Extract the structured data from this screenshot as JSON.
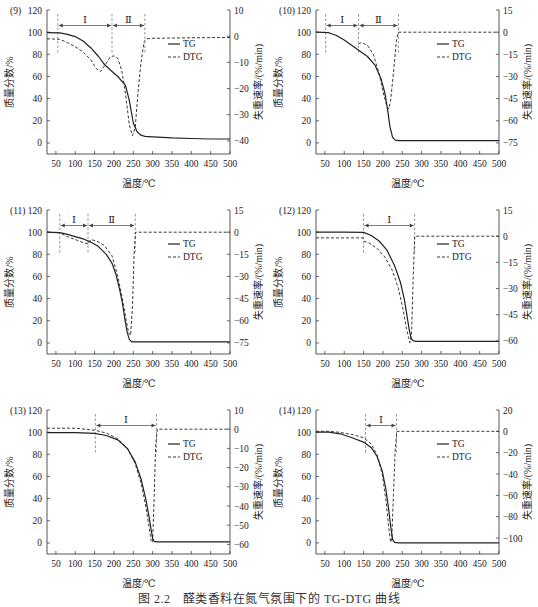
{
  "figure": {
    "caption": "图 2.2　醛类香料在氮气氛围下的 TG-DTG 曲线"
  },
  "chart_data": [
    {
      "type": "line",
      "panel_label": "(9)",
      "xlabel": "温度/℃",
      "ylabel": "质量分数/%",
      "y2label": "失重速率/(%/min)",
      "xlim": [
        27,
        500
      ],
      "ylim": [
        -10,
        120
      ],
      "y2lim": [
        -45,
        10
      ],
      "xticks": [
        50,
        100,
        150,
        200,
        250,
        300,
        350,
        400,
        450,
        500
      ],
      "yticks": [
        0,
        20,
        40,
        60,
        80,
        100,
        120
      ],
      "y2ticks": [
        -40,
        -30,
        -20,
        -10,
        0,
        10
      ],
      "legend": [
        "TG",
        "DTG"
      ],
      "stages": [
        {
          "label": "Ⅰ",
          "from": 55,
          "to": 195
        },
        {
          "label": "Ⅱ",
          "from": 195,
          "to": 280
        }
      ],
      "series": [
        {
          "name": "TG",
          "axis": "left",
          "style": "solid",
          "x": [
            27,
            60,
            80,
            100,
            120,
            140,
            160,
            175,
            190,
            210,
            230,
            240,
            250,
            260,
            270,
            280,
            300,
            350,
            400,
            450,
            500
          ],
          "y": [
            99.5,
            99.3,
            98,
            96,
            92,
            86,
            78,
            71,
            66,
            60,
            52,
            38,
            18,
            10,
            7,
            6,
            5.5,
            4.5,
            4,
            3.5,
            3.5
          ]
        },
        {
          "name": "DTG",
          "axis": "right",
          "style": "dashed",
          "x": [
            27,
            60,
            80,
            100,
            120,
            140,
            155,
            165,
            175,
            190,
            200,
            210,
            220,
            230,
            240,
            248,
            255,
            262,
            270,
            278,
            285,
            300,
            400,
            500
          ],
          "y": [
            -1,
            -1.2,
            -2.5,
            -4,
            -6,
            -9,
            -12.5,
            -13.5,
            -11.5,
            -8,
            -7.5,
            -8.5,
            -13,
            -22,
            -34,
            -38,
            -35,
            -22,
            -10,
            -2,
            -1,
            -0.8,
            -0.6,
            -0.5
          ]
        }
      ]
    },
    {
      "type": "line",
      "panel_label": "(10)",
      "xlabel": "温度/℃",
      "ylabel": "质量分数/%",
      "y2label": "失重速率/(%/min)",
      "xlim": [
        27,
        500
      ],
      "ylim": [
        -10,
        120
      ],
      "y2lim": [
        -82.5,
        15
      ],
      "xticks": [
        50,
        100,
        150,
        200,
        250,
        300,
        350,
        400,
        450,
        500
      ],
      "yticks": [
        0,
        20,
        40,
        60,
        80,
        100,
        120
      ],
      "y2ticks": [
        -75,
        -60,
        -45,
        -30,
        -15,
        0,
        15
      ],
      "legend": [
        "TG",
        "DTG"
      ],
      "stages": [
        {
          "label": "Ⅰ",
          "from": 52,
          "to": 137
        },
        {
          "label": "Ⅱ",
          "from": 137,
          "to": 240
        }
      ],
      "series": [
        {
          "name": "TG",
          "axis": "left",
          "style": "solid",
          "x": [
            27,
            60,
            80,
            100,
            120,
            140,
            160,
            180,
            195,
            205,
            212,
            218,
            225,
            232,
            240,
            260,
            300,
            400,
            500
          ],
          "y": [
            100,
            99.5,
            97,
            93,
            88,
            83,
            78,
            70,
            58,
            45,
            30,
            15,
            5,
            2.5,
            2,
            2,
            2,
            2,
            2
          ]
        },
        {
          "name": "DTG",
          "axis": "right",
          "style": "dashed",
          "x": [
            137,
            145,
            160,
            175,
            190,
            200,
            210,
            215,
            220,
            228,
            235,
            240,
            260,
            350,
            500
          ],
          "y": [
            -8,
            -7,
            -9,
            -15,
            -28,
            -40,
            -50,
            -52,
            -46,
            -25,
            -5,
            0,
            0,
            0,
            0
          ]
        }
      ]
    },
    {
      "type": "line",
      "panel_label": "(11)",
      "xlabel": "温度/℃",
      "ylabel": "质量分数/%",
      "y2label": "失重速率/(%/min)",
      "xlim": [
        27,
        500
      ],
      "ylim": [
        -10,
        120
      ],
      "y2lim": [
        -82.5,
        15
      ],
      "xticks": [
        50,
        100,
        150,
        200,
        250,
        300,
        350,
        400,
        450,
        500
      ],
      "yticks": [
        0,
        20,
        40,
        60,
        80,
        100,
        120
      ],
      "y2ticks": [
        -75,
        -60,
        -45,
        -30,
        -15,
        0,
        15
      ],
      "legend": [
        "TG",
        "DTG"
      ],
      "stages": [
        {
          "label": "Ⅰ",
          "from": 60,
          "to": 133
        },
        {
          "label": "Ⅱ",
          "from": 133,
          "to": 255
        }
      ],
      "series": [
        {
          "name": "TG",
          "axis": "left",
          "style": "solid",
          "x": [
            27,
            60,
            80,
            100,
            120,
            140,
            160,
            180,
            195,
            205,
            215,
            222,
            228,
            234,
            240,
            246,
            260,
            350,
            500
          ],
          "y": [
            100,
            99.5,
            98,
            96,
            94,
            91,
            87,
            80,
            72,
            62,
            48,
            36,
            22,
            10,
            3,
            1,
            1,
            1,
            1
          ]
        },
        {
          "name": "DTG",
          "axis": "right",
          "style": "dashed",
          "x": [
            27,
            60,
            80,
            100,
            120,
            133,
            140,
            155,
            175,
            195,
            210,
            222,
            232,
            238,
            243,
            248,
            252,
            256,
            300,
            500
          ],
          "y": [
            0,
            -0.5,
            -3,
            -5,
            -7,
            -8,
            -5,
            -6,
            -9,
            -16,
            -30,
            -45,
            -60,
            -68,
            -70,
            -50,
            -15,
            0,
            0,
            0
          ]
        }
      ]
    },
    {
      "type": "line",
      "panel_label": "(12)",
      "xlabel": "温度/℃",
      "ylabel": "质量分数/%",
      "y2label": "失重速率/(%/min)",
      "xlim": [
        27,
        500
      ],
      "ylim": [
        -10,
        120
      ],
      "y2lim": [
        -67.5,
        15
      ],
      "xticks": [
        50,
        100,
        150,
        200,
        250,
        300,
        350,
        400,
        450,
        500
      ],
      "yticks": [
        0,
        20,
        40,
        60,
        80,
        100,
        120
      ],
      "y2ticks": [
        -60,
        -45,
        -30,
        -15,
        0,
        15
      ],
      "legend": [
        "TG",
        "DTG"
      ],
      "stages": [
        {
          "label": "Ⅰ",
          "from": 150,
          "to": 282
        }
      ],
      "series": [
        {
          "name": "TG",
          "axis": "left",
          "style": "solid",
          "x": [
            27,
            100,
            150,
            170,
            190,
            210,
            230,
            245,
            255,
            262,
            268,
            273,
            278,
            285,
            300,
            400,
            500
          ],
          "y": [
            100,
            100,
            99.8,
            97,
            92,
            84,
            70,
            55,
            40,
            25,
            12,
            4,
            2,
            1.5,
            1.5,
            1.5,
            1.5
          ]
        },
        {
          "name": "DTG",
          "axis": "right",
          "style": "dashed",
          "x": [
            27,
            100,
            148,
            152,
            165,
            185,
            205,
            225,
            240,
            252,
            260,
            266,
            270,
            274,
            278,
            282,
            300,
            500
          ],
          "y": [
            -1,
            -1,
            -1,
            -3,
            -4,
            -7,
            -12,
            -20,
            -30,
            -42,
            -52,
            -58,
            -61,
            -55,
            -25,
            0,
            0,
            0
          ]
        }
      ]
    },
    {
      "type": "line",
      "panel_label": "(13)",
      "xlabel": "温度/℃",
      "ylabel": "质量分数/%",
      "y2label": "失重速率/(%/min)",
      "xlim": [
        27,
        500
      ],
      "ylim": [
        -10,
        120
      ],
      "y2lim": [
        -65,
        10
      ],
      "xticks": [
        50,
        100,
        150,
        200,
        250,
        300,
        350,
        400,
        450,
        500
      ],
      "yticks": [
        0,
        20,
        40,
        60,
        80,
        100,
        120
      ],
      "y2ticks": [
        -60,
        -50,
        -40,
        -30,
        -20,
        -10,
        0,
        10
      ],
      "legend": [
        "TG",
        "DTG"
      ],
      "stages": [
        {
          "label": "Ⅰ",
          "from": 152,
          "to": 310
        }
      ],
      "series": [
        {
          "name": "TG",
          "axis": "left",
          "style": "solid",
          "x": [
            27,
            100,
            150,
            180,
            210,
            235,
            255,
            270,
            282,
            290,
            296,
            300,
            304,
            310,
            350,
            500
          ],
          "y": [
            99.5,
            99.5,
            99,
            97,
            93,
            85,
            73,
            58,
            40,
            25,
            12,
            4,
            1.5,
            1,
            1,
            1
          ]
        },
        {
          "name": "DTG",
          "axis": "right",
          "style": "dashed",
          "x": [
            27,
            100,
            150,
            180,
            210,
            235,
            255,
            270,
            282,
            290,
            296,
            300,
            304,
            308,
            312,
            350,
            500
          ],
          "y": [
            0.5,
            0.5,
            -0.5,
            -2,
            -5,
            -10,
            -18,
            -28,
            -40,
            -50,
            -58,
            -59,
            -35,
            -8,
            0,
            0,
            0
          ]
        }
      ]
    },
    {
      "type": "line",
      "panel_label": "(14)",
      "xlabel": "温度/℃",
      "ylabel": "质量分数/%",
      "y2label": "失重速率/(%/min)",
      "xlim": [
        27,
        500
      ],
      "ylim": [
        -10,
        120
      ],
      "y2lim": [
        -115,
        20
      ],
      "xticks": [
        50,
        100,
        150,
        200,
        250,
        300,
        350,
        400,
        450,
        500
      ],
      "yticks": [
        0,
        20,
        40,
        60,
        80,
        100,
        120
      ],
      "y2ticks": [
        -100,
        -80,
        -60,
        -40,
        -20,
        0,
        20
      ],
      "legend": [
        "TG",
        "DTG"
      ],
      "stages": [
        {
          "label": "Ⅰ",
          "from": 155,
          "to": 235
        }
      ],
      "series": [
        {
          "name": "TG",
          "axis": "left",
          "style": "solid",
          "x": [
            27,
            60,
            90,
            120,
            150,
            170,
            185,
            198,
            208,
            215,
            220,
            225,
            230,
            240,
            300,
            500
          ],
          "y": [
            100,
            100,
            98.5,
            95,
            91,
            86,
            78,
            65,
            48,
            30,
            15,
            3,
            0.5,
            0,
            0,
            0
          ]
        },
        {
          "name": "DTG",
          "axis": "right",
          "style": "dashed",
          "x": [
            27,
            60,
            90,
            120,
            150,
            170,
            185,
            198,
            208,
            215,
            220,
            223,
            227,
            232,
            236,
            300,
            500
          ],
          "y": [
            0,
            0,
            -1,
            -3,
            -6,
            -12,
            -22,
            -40,
            -65,
            -90,
            -104,
            -100,
            -60,
            -15,
            0,
            0,
            0
          ]
        }
      ]
    }
  ]
}
